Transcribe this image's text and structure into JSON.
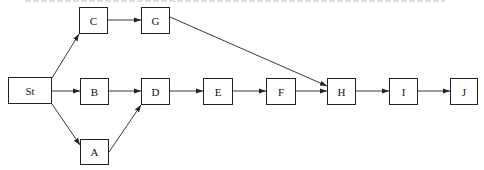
{
  "diagram": {
    "type": "network-diagram",
    "nodes": [
      {
        "id": "St",
        "label": "St",
        "x": 8,
        "y": 77,
        "w": 44,
        "h": 27
      },
      {
        "id": "C",
        "label": "C",
        "x": 79,
        "y": 7,
        "w": 29,
        "h": 27
      },
      {
        "id": "G",
        "label": "G",
        "x": 141,
        "y": 7,
        "w": 29,
        "h": 27
      },
      {
        "id": "B",
        "label": "B",
        "x": 80,
        "y": 78,
        "w": 29,
        "h": 27
      },
      {
        "id": "D",
        "label": "D",
        "x": 141,
        "y": 78,
        "w": 29,
        "h": 27
      },
      {
        "id": "A",
        "label": "A",
        "x": 80,
        "y": 139,
        "w": 29,
        "h": 26
      },
      {
        "id": "E",
        "label": "E",
        "x": 203,
        "y": 78,
        "w": 30,
        "h": 27
      },
      {
        "id": "F",
        "label": "F",
        "x": 266,
        "y": 78,
        "w": 30,
        "h": 27
      },
      {
        "id": "H",
        "label": "H",
        "x": 327,
        "y": 78,
        "w": 29,
        "h": 27
      },
      {
        "id": "I",
        "label": "I",
        "x": 389,
        "y": 78,
        "w": 29,
        "h": 27
      },
      {
        "id": "J",
        "label": "J",
        "x": 450,
        "y": 78,
        "w": 28,
        "h": 27
      }
    ],
    "edges": [
      {
        "from": "St",
        "to": "C",
        "x1": 52,
        "y1": 78,
        "x2": 79,
        "y2": 34
      },
      {
        "from": "St",
        "to": "B",
        "x1": 52,
        "y1": 91,
        "x2": 80,
        "y2": 91
      },
      {
        "from": "St",
        "to": "A",
        "x1": 52,
        "y1": 104,
        "x2": 80,
        "y2": 145
      },
      {
        "from": "C",
        "to": "G",
        "x1": 108,
        "y1": 20,
        "x2": 141,
        "y2": 20
      },
      {
        "from": "B",
        "to": "D",
        "x1": 109,
        "y1": 91,
        "x2": 141,
        "y2": 91
      },
      {
        "from": "A",
        "to": "D",
        "x1": 109,
        "y1": 152,
        "x2": 141,
        "y2": 105
      },
      {
        "from": "G",
        "to": "H",
        "x1": 170,
        "y1": 17,
        "x2": 327,
        "y2": 86
      },
      {
        "from": "D",
        "to": "E",
        "x1": 170,
        "y1": 91,
        "x2": 203,
        "y2": 91
      },
      {
        "from": "E",
        "to": "F",
        "x1": 233,
        "y1": 91,
        "x2": 266,
        "y2": 91
      },
      {
        "from": "F",
        "to": "H",
        "x1": 296,
        "y1": 91,
        "x2": 327,
        "y2": 91
      },
      {
        "from": "H",
        "to": "I",
        "x1": 356,
        "y1": 91,
        "x2": 389,
        "y2": 91
      },
      {
        "from": "I",
        "to": "J",
        "x1": 418,
        "y1": 91,
        "x2": 450,
        "y2": 91
      }
    ],
    "colors": {
      "stroke": "#222222",
      "background": "#ffffff"
    }
  }
}
